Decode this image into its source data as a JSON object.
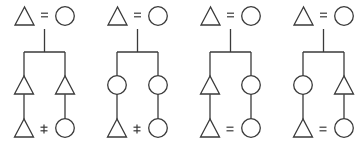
{
  "colors": {
    "stroke": "#3a3a3a",
    "background": "#ffffff"
  },
  "symbols": {
    "male": "triangle",
    "female": "circle",
    "marriage": "=",
    "marriage_prohibited": "≠"
  },
  "diagrams": [
    {
      "id": "diagram-1",
      "offset_x": 0,
      "top_couple": {
        "left": "triangle",
        "relation": "=",
        "right": "circle"
      },
      "children": [
        "triangle",
        "triangle"
      ],
      "grandchildren": {
        "left": "triangle",
        "relation": "≠",
        "right": "circle"
      }
    },
    {
      "id": "diagram-2",
      "offset_x": 93,
      "top_couple": {
        "left": "triangle",
        "relation": "=",
        "right": "circle"
      },
      "children": [
        "circle",
        "circle"
      ],
      "grandchildren": {
        "left": "triangle",
        "relation": "≠",
        "right": "circle"
      }
    },
    {
      "id": "diagram-3",
      "offset_x": 186,
      "top_couple": {
        "left": "triangle",
        "relation": "=",
        "right": "circle"
      },
      "children": [
        "triangle",
        "circle"
      ],
      "grandchildren": {
        "left": "triangle",
        "relation": "=",
        "right": "circle"
      }
    },
    {
      "id": "diagram-4",
      "offset_x": 279,
      "top_couple": {
        "left": "triangle",
        "relation": "=",
        "right": "circle"
      },
      "children": [
        "circle",
        "triangle"
      ],
      "grandchildren": {
        "left": "triangle",
        "relation": "=",
        "right": "circle"
      }
    }
  ]
}
